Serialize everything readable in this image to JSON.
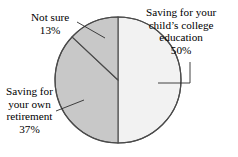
{
  "chart_data": {
    "type": "pie",
    "title": "",
    "subtitle": "",
    "xlabel": "",
    "ylabel": "",
    "legend_position": "none",
    "grid": false,
    "categories": [
      "Saving for your child's college education",
      "Saving for your own retirement",
      "Not sure"
    ],
    "values": [
      50,
      37,
      13
    ],
    "value_suffix": "%",
    "slices": [
      {
        "name": "Saving for your child's college education",
        "value": 50,
        "value_label": "50%",
        "color": "#f2f2f2",
        "start_angle_deg": 0,
        "end_angle_deg": 180
      },
      {
        "name": "Saving for your own retirement",
        "value": 37,
        "value_label": "37%",
        "color": "#c8c8c8",
        "start_angle_deg": 180,
        "end_angle_deg": 313.2
      },
      {
        "name": "Not sure",
        "value": 13,
        "value_label": "13%",
        "color": "#c8c8c8",
        "start_angle_deg": 313.2,
        "end_angle_deg": 360
      }
    ],
    "outline_color": "#4a4a4a",
    "background_color": "#ffffff"
  },
  "labels": {
    "college": {
      "line1": "Saving for your",
      "line2": "child’s college",
      "line3": "education",
      "line4": "50%"
    },
    "notsure": {
      "line1": "Not sure",
      "line2": "13%"
    },
    "retirement": {
      "line1": "Saving for",
      "line2": "your own",
      "line3": "retirement",
      "line4": "37%"
    }
  }
}
